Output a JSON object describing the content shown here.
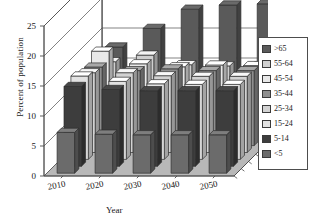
{
  "chart_data": {
    "type": "bar",
    "subtype": "3d-grouped-bar",
    "title": "",
    "xlabel": "Year",
    "ylabel": "Percent of population",
    "zlabel": "",
    "categories": [
      "2010",
      "2020",
      "2030",
      "2040",
      "2050"
    ],
    "ylim": [
      0,
      25
    ],
    "yticks": [
      "0",
      "5",
      "10",
      "15",
      "20",
      "25"
    ],
    "grid": true,
    "legend_position": "right",
    "series": [
      {
        "name": "<5",
        "color": "#6b6b6b",
        "values": [
          6.8,
          6.5,
          6.4,
          6.4,
          6.4
        ]
      },
      {
        "name": "5-14",
        "color": "#3d3d3d",
        "values": [
          13.3,
          12.8,
          12.6,
          12.6,
          12.6
        ]
      },
      {
        "name": "15-24",
        "color": "#e2e2e2",
        "values": [
          13.9,
          13.0,
          12.6,
          12.5,
          12.5
        ]
      },
      {
        "name": "25-34",
        "color": "#d2d2d2",
        "values": [
          13.3,
          13.3,
          12.8,
          12.7,
          12.7
        ]
      },
      {
        "name": "35-44",
        "color": "#8e8e8e",
        "values": [
          13.1,
          12.5,
          12.8,
          12.5,
          12.5
        ]
      },
      {
        "name": "45-54",
        "color": "#e8e8e8",
        "values": [
          14.6,
          12.5,
          12.0,
          12.3,
          12.2
        ]
      },
      {
        "name": "55-64",
        "color": "#cfcfcf",
        "values": [
          11.7,
          12.8,
          11.2,
          11.0,
          11.0
        ]
      },
      {
        "name": ">65",
        "color": "#5a5a5a",
        "values": [
          13.0,
          16.1,
          19.3,
          20.0,
          20.2
        ]
      }
    ]
  },
  "axes": {
    "y_title": "Percent of population",
    "x_title": "Year",
    "y_ticks": [
      "25",
      "20",
      "15",
      "10",
      "5",
      "0"
    ],
    "x_ticks": [
      "2010",
      "2020",
      "2030",
      "2040",
      "2050"
    ]
  },
  "legend": {
    "items": [
      {
        "label": ">65",
        "color": "#5a5a5a"
      },
      {
        "label": "55-64",
        "color": "#cfcfcf"
      },
      {
        "label": "45-54",
        "color": "#e8e8e8"
      },
      {
        "label": "35-44",
        "color": "#8e8e8e"
      },
      {
        "label": "25-34",
        "color": "#d2d2d2"
      },
      {
        "label": "15-24",
        "color": "#e2e2e2"
      },
      {
        "label": "5-14",
        "color": "#3d3d3d"
      },
      {
        "label": "<5",
        "color": "#6b6b6b"
      }
    ]
  },
  "style": {
    "floor_color": "#b8b8b8",
    "wall_color": "#ffffff",
    "line_color": "#4d4d4d",
    "text_color": "#1a1a1a"
  }
}
